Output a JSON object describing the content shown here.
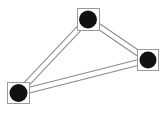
{
  "diagram": {
    "type": "graph",
    "colors": {
      "background": "#ffffff",
      "node_fill": "#111111",
      "node_box_stroke": "#9a9a9a",
      "edge_stroke": "#8a8a8a"
    },
    "nodes": [
      {
        "id": "top",
        "cx": 88,
        "cy": 19,
        "box": [
          77,
          8,
          23,
          23
        ],
        "r": 9
      },
      {
        "id": "right",
        "cx": 148,
        "cy": 60,
        "box": [
          137,
          49,
          22,
          22
        ],
        "r": 9
      },
      {
        "id": "left",
        "cx": 18,
        "cy": 93,
        "box": [
          7,
          82,
          23,
          22
        ],
        "r": 9
      }
    ],
    "edges": [
      {
        "from": "left",
        "to": "top",
        "style": "double-line"
      },
      {
        "from": "top",
        "to": "right",
        "style": "double-line"
      },
      {
        "from": "left",
        "to": "right",
        "style": "double-line"
      }
    ]
  }
}
